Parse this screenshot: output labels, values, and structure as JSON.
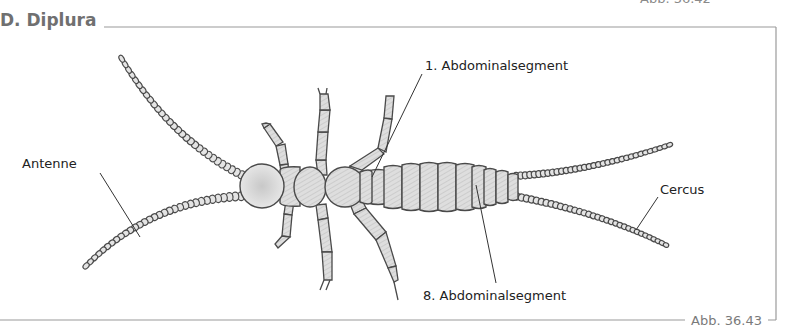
{
  "figure": {
    "top_cut_caption": "Abb. 36.42",
    "title": "D. Diplura",
    "caption": "Abb. 36.43"
  },
  "labels": {
    "antenna": "Antenne",
    "abdominal_segment_1": "1. Abdominalsegment",
    "abdominal_segment_8": "8. Abdominalsegment",
    "cercus": "Cercus"
  },
  "colors": {
    "frame": "#9a9a9a",
    "outline": "#4a4a4a",
    "fill": "#dcdcdc",
    "text": "#222222",
    "title": "#707070"
  }
}
